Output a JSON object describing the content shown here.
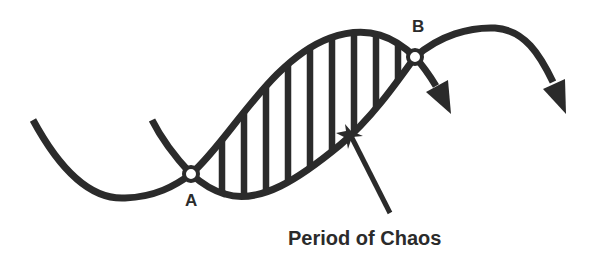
{
  "diagram": {
    "points": [
      {
        "id": "A",
        "label": "A"
      },
      {
        "id": "B",
        "label": "B"
      }
    ],
    "caption": "Period of Chaos",
    "colors": {
      "ink": "#2b2b2b",
      "background": "#ffffff"
    }
  }
}
